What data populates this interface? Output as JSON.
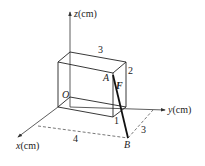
{
  "diagram": {
    "type": "3d-coordinate-box-force",
    "axes": {
      "z": {
        "label_var": "z",
        "label_unit": "(cm)"
      },
      "y": {
        "label_var": "y",
        "label_unit": "(cm)"
      },
      "x": {
        "label_var": "x",
        "label_unit": "(cm)"
      }
    },
    "points": {
      "origin": "O",
      "A": "A",
      "B": "B"
    },
    "force_label": "F",
    "dimensions": {
      "box_width_y": "3",
      "box_height_z": "2",
      "box_depth_x": "1",
      "ground_x": "4",
      "ground_y": "3"
    }
  }
}
